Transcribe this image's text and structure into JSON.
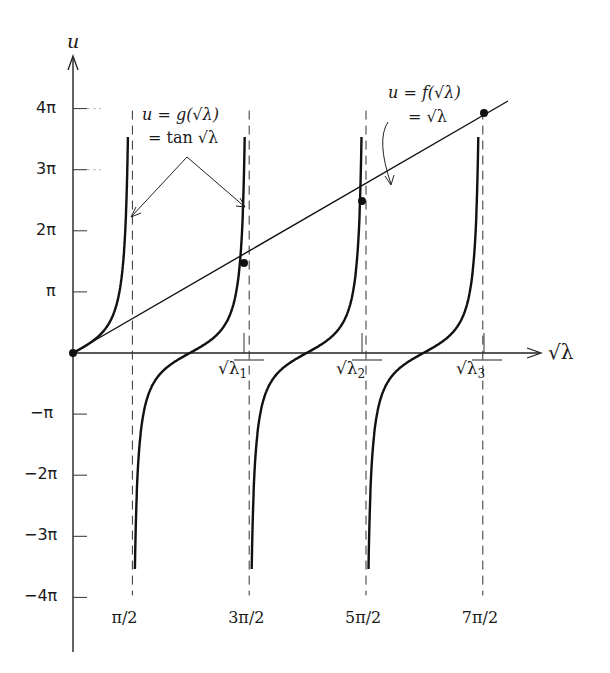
{
  "chart_data": {
    "type": "line",
    "title": "",
    "xlabel": "√λ",
    "ylabel": "u",
    "y_ticks": [
      "4π",
      "3π",
      "2π",
      "π",
      "-π",
      "-2π",
      "-3π",
      "-4π"
    ],
    "y_tick_values_in_pi": [
      4,
      3,
      2,
      1,
      -1,
      -2,
      -3,
      -4
    ],
    "x_ticks_bottom": [
      "π/2",
      "3π/2",
      "5π/2",
      "7π/2"
    ],
    "x_tick_values_in_pi": [
      0.5,
      1.5,
      2.5,
      3.5
    ],
    "x_ticks_axis": [
      "√λ1",
      "√λ2",
      "√λ3"
    ],
    "series": [
      {
        "name": "u = g(√λ) = tan √λ",
        "kind": "tan",
        "clip_in_pi": 3.55
      },
      {
        "name": "u = f(√λ) = √λ",
        "kind": "line"
      }
    ],
    "intersections": [
      {
        "label": "√λ1",
        "x_in_pi": 1.43,
        "y_in_pi": 1.48
      },
      {
        "label": "√λ2",
        "x_in_pi": 2.46,
        "y_in_pi": 2.5
      },
      {
        "label": "√λ3",
        "x_in_pi": 3.47,
        "y_in_pi": 3.9
      }
    ],
    "asymptotes_in_pi": [
      0.5,
      1.5,
      2.5,
      3.5
    ],
    "ylim_in_pi": [
      -4,
      4
    ],
    "xlim_in_pi": [
      0,
      4
    ]
  },
  "labels": {
    "y_axis": "u",
    "x_axis": "√λ",
    "g_line1": "u = g(√λ)",
    "g_line2": "= tan √λ",
    "f_line1": "u = f(√λ)",
    "f_line2": "= √λ",
    "lam1": "√λ",
    "lam2": "√λ",
    "lam3": "√λ",
    "sub1": "1",
    "sub2": "2",
    "sub3": "3"
  }
}
